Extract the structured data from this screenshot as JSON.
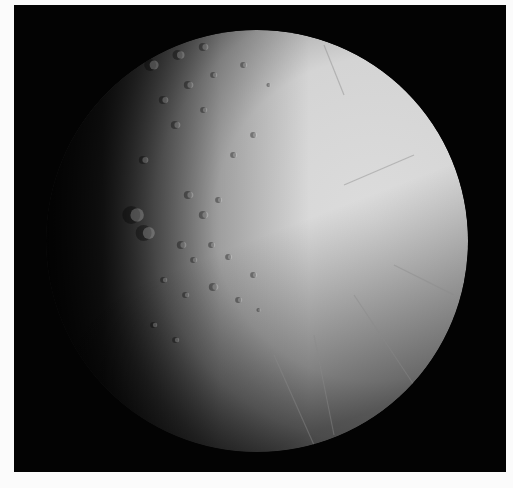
{
  "image": {
    "subject": "Icy moon disk, sunlit from the right, cratered terrain near the left terminator and grooved plains on the right",
    "background_color": "#ffffff",
    "frame_color": "#030303"
  },
  "moon": {
    "center_x": 243,
    "center_y": 236,
    "radius": 211,
    "colors": {
      "lit": "#dcdcdc",
      "mid": "#a8a8a8",
      "terminator": "#5a5a5a",
      "shadow": "#0a0a0a"
    },
    "craters": [
      {
        "x": 120,
        "y": 210,
        "r": 9
      },
      {
        "x": 132,
        "y": 228,
        "r": 8
      },
      {
        "x": 138,
        "y": 60,
        "r": 6
      },
      {
        "x": 165,
        "y": 50,
        "r": 5
      },
      {
        "x": 190,
        "y": 42,
        "r": 4
      },
      {
        "x": 150,
        "y": 95,
        "r": 4
      },
      {
        "x": 175,
        "y": 80,
        "r": 4
      },
      {
        "x": 200,
        "y": 70,
        "r": 3
      },
      {
        "x": 162,
        "y": 120,
        "r": 4
      },
      {
        "x": 190,
        "y": 105,
        "r": 3
      },
      {
        "x": 175,
        "y": 190,
        "r": 4
      },
      {
        "x": 190,
        "y": 210,
        "r": 4
      },
      {
        "x": 205,
        "y": 195,
        "r": 3
      },
      {
        "x": 168,
        "y": 240,
        "r": 4
      },
      {
        "x": 180,
        "y": 255,
        "r": 3
      },
      {
        "x": 198,
        "y": 240,
        "r": 3
      },
      {
        "x": 215,
        "y": 252,
        "r": 3
      },
      {
        "x": 150,
        "y": 275,
        "r": 3
      },
      {
        "x": 172,
        "y": 290,
        "r": 3
      },
      {
        "x": 200,
        "y": 282,
        "r": 4
      },
      {
        "x": 225,
        "y": 295,
        "r": 3
      },
      {
        "x": 240,
        "y": 270,
        "r": 3
      },
      {
        "x": 140,
        "y": 320,
        "r": 3
      },
      {
        "x": 162,
        "y": 335,
        "r": 3
      },
      {
        "x": 245,
        "y": 305,
        "r": 2
      },
      {
        "x": 220,
        "y": 150,
        "r": 3
      },
      {
        "x": 240,
        "y": 130,
        "r": 3
      },
      {
        "x": 230,
        "y": 60,
        "r": 3
      },
      {
        "x": 255,
        "y": 80,
        "r": 2
      },
      {
        "x": 130,
        "y": 155,
        "r": 4
      }
    ],
    "fractures": [
      {
        "x1": 330,
        "y1": 180,
        "x2": 400,
        "y2": 150
      },
      {
        "x1": 340,
        "y1": 290,
        "x2": 400,
        "y2": 380
      },
      {
        "x1": 300,
        "y1": 330,
        "x2": 320,
        "y2": 430
      },
      {
        "x1": 260,
        "y1": 350,
        "x2": 300,
        "y2": 440
      },
      {
        "x1": 380,
        "y1": 260,
        "x2": 440,
        "y2": 290
      },
      {
        "x1": 310,
        "y1": 40,
        "x2": 330,
        "y2": 90
      }
    ]
  },
  "caption": {
    "text": ""
  }
}
